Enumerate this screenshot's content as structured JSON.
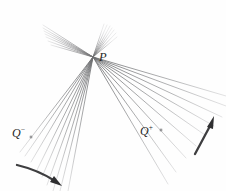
{
  "figure": {
    "background_color": "#fefefe",
    "width": 226,
    "height": 191,
    "focal_point": {
      "name": "P",
      "label": "P",
      "x": 93,
      "y": 57,
      "description": "convergence point of all ray families"
    },
    "sources": [
      {
        "name": "Q-minus",
        "label_base": "Q",
        "label_sup": "−",
        "label_x": 12,
        "label_y": 126,
        "marker_x": 31,
        "marker_y": 137,
        "description": "past conjugate point, lower-left"
      },
      {
        "name": "Q-plus",
        "label_base": "Q",
        "label_sup": "+",
        "label_x": 140,
        "label_y": 124,
        "marker_x": 161,
        "marker_y": 130,
        "description": "future conjugate point, lower-right"
      }
    ],
    "ray_color": "#9a9a9c",
    "ray_color_dark": "#6f7072",
    "arrow_color": "#3c3c3e",
    "ray_bundles": [
      {
        "name": "upper-left-fan",
        "count": 7,
        "from": "P",
        "direction": "up-left",
        "spread_description": "narrow fan toward upper-left edge"
      },
      {
        "name": "upper-right-fan",
        "count": 7,
        "from": "P",
        "direction": "up",
        "spread_description": "tight fan rising steeply above P"
      },
      {
        "name": "lower-left-fan",
        "count": 9,
        "from": "P",
        "direction": "down-left",
        "spread_description": "broad fan passing through Q-minus"
      },
      {
        "name": "lower-right-fan",
        "count": 9,
        "from": "P",
        "direction": "down-right",
        "spread_description": "broad fan passing through Q-plus"
      }
    ],
    "arrows": [
      {
        "name": "arrow-lower-left",
        "label": "",
        "start_x": 18,
        "start_y": 166,
        "end_x": 62,
        "end_y": 186,
        "direction": "down-right",
        "curved": true
      },
      {
        "name": "arrow-lower-right",
        "label": "",
        "start_x": 196,
        "start_y": 152,
        "end_x": 215,
        "end_y": 117,
        "direction": "up-right",
        "curved": true
      }
    ]
  }
}
